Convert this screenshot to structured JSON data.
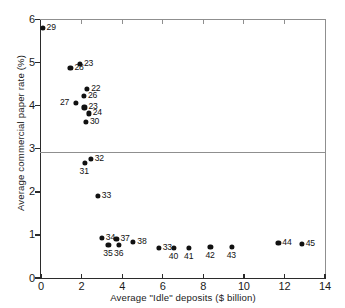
{
  "chart_data": {
    "type": "scatter",
    "title": "",
    "xlabel": "Average \"Idle\" deposits ($ billion)",
    "ylabel": "Average commercial paper rate (%)",
    "xlim": [
      0,
      14
    ],
    "ylim": [
      0,
      6
    ],
    "xticks": [
      "0",
      "2",
      "4",
      "6",
      "8",
      "10",
      "12",
      "14"
    ],
    "xtick_values": [
      0,
      2,
      4,
      6,
      8,
      10,
      12,
      14
    ],
    "yticks": [
      "0",
      "1",
      "2",
      "3",
      "4",
      "5",
      "6"
    ],
    "ytick_values": [
      0,
      1,
      2,
      3,
      4,
      5,
      6
    ],
    "grid": false,
    "legend": null,
    "points": [
      {
        "label": "29",
        "x": 0.08,
        "y": 5.8,
        "label_pos": "right"
      },
      {
        "label": "28",
        "x": 1.45,
        "y": 4.88,
        "label_pos": "right"
      },
      {
        "label": "23",
        "x": 1.92,
        "y": 4.97,
        "label_pos": "right"
      },
      {
        "label": "22",
        "x": 2.28,
        "y": 4.38,
        "label_pos": "right"
      },
      {
        "label": "26",
        "x": 2.12,
        "y": 4.22,
        "label_pos": "right"
      },
      {
        "label": "27",
        "x": 1.72,
        "y": 4.07,
        "label_pos": "left"
      },
      {
        "label": "23",
        "x": 2.14,
        "y": 3.96,
        "label_pos": "right"
      },
      {
        "label": "24",
        "x": 2.35,
        "y": 3.82,
        "label_pos": "right"
      },
      {
        "label": "30",
        "x": 2.22,
        "y": 3.62,
        "label_pos": "right"
      },
      {
        "label": "31",
        "x": 2.15,
        "y": 2.68,
        "label_pos": "below"
      },
      {
        "label": "32",
        "x": 2.45,
        "y": 2.76,
        "label_pos": "right"
      },
      {
        "label": "33",
        "x": 2.8,
        "y": 1.9,
        "label_pos": "right"
      },
      {
        "label": "34",
        "x": 3.0,
        "y": 0.93,
        "label_pos": "right"
      },
      {
        "label": "37",
        "x": 3.72,
        "y": 0.91,
        "label_pos": "right"
      },
      {
        "label": "35",
        "x": 3.32,
        "y": 0.76,
        "label_pos": "below"
      },
      {
        "label": "36",
        "x": 3.85,
        "y": 0.76,
        "label_pos": "below"
      },
      {
        "label": "38",
        "x": 4.55,
        "y": 0.84,
        "label_pos": "right"
      },
      {
        "label": "33",
        "x": 5.8,
        "y": 0.7,
        "label_pos": "right"
      },
      {
        "label": "40",
        "x": 6.55,
        "y": 0.7,
        "label_pos": "below"
      },
      {
        "label": "41",
        "x": 7.3,
        "y": 0.7,
        "label_pos": "below"
      },
      {
        "label": "42",
        "x": 8.35,
        "y": 0.72,
        "label_pos": "below"
      },
      {
        "label": "43",
        "x": 9.4,
        "y": 0.72,
        "label_pos": "below"
      },
      {
        "label": "44",
        "x": 11.7,
        "y": 0.82,
        "label_pos": "right"
      },
      {
        "label": "45",
        "x": 12.85,
        "y": 0.8,
        "label_pos": "right"
      }
    ],
    "colors": {
      "marker": "#111111",
      "axis": "#2b2b2b",
      "frame": "#8f8f8f",
      "background": "#ffffff"
    }
  }
}
